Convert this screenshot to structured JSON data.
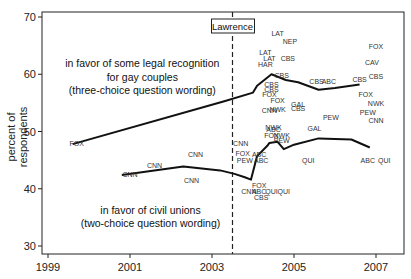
{
  "chart_data": {
    "type": "line",
    "title": "",
    "xlabel": "",
    "ylabel": "percent of respondents",
    "xlim": [
      1998.8,
      2007.8
    ],
    "ylim": [
      29.5,
      71
    ],
    "x_ticks": [
      1999,
      2001,
      2003,
      2005,
      2007
    ],
    "y_ticks": [
      30,
      40,
      50,
      60,
      70
    ],
    "grid": false,
    "legend": null,
    "event_line": {
      "x": 2003.5,
      "label": "Lawrence",
      "style": "dashed"
    },
    "annotations": [
      {
        "text": "in favor of some legal recognition",
        "x": 2001.3,
        "y": 61.3
      },
      {
        "text": "for gay couples",
        "x": 2001.3,
        "y": 58.9
      },
      {
        "text": "(three-choice question wording)",
        "x": 2001.3,
        "y": 56.5
      },
      {
        "text": "in favor of civil unions",
        "x": 2001.5,
        "y": 35.6
      },
      {
        "text": "(two-choice question wording)",
        "x": 2001.5,
        "y": 33.3
      }
    ],
    "series": [
      {
        "name": "legal recognition (three-choice wording)",
        "x": [
          1999.6,
          2003.3,
          2004.0,
          2004.1,
          2004.45,
          2004.8,
          2005.1,
          2005.6,
          2006.0,
          2006.6
        ],
        "y": [
          47.8,
          55.3,
          56.8,
          58.0,
          60.0,
          59.0,
          58.6,
          57.3,
          57.6,
          58.2
        ]
      },
      {
        "name": "civil unions (two-choice wording)",
        "x": [
          2000.8,
          2002.3,
          2003.2,
          2003.55,
          2003.8,
          2003.95,
          2004.1,
          2004.35,
          2004.4,
          2004.6,
          2004.75,
          2005.0,
          2005.6,
          2006.4,
          2006.85
        ],
        "y": [
          42.4,
          43.9,
          43.2,
          42.6,
          42.0,
          41.6,
          45.7,
          47.5,
          48.0,
          48.2,
          46.9,
          47.7,
          48.8,
          48.6,
          47.2
        ]
      }
    ],
    "poll_labels": [
      {
        "text": "FOX",
        "x": 1999.7,
        "y": 47.5
      },
      {
        "text": "CNN",
        "x": 2001.0,
        "y": 42.0
      },
      {
        "text": "CNN",
        "x": 2001.6,
        "y": 43.7
      },
      {
        "text": "CNN",
        "x": 2002.6,
        "y": 45.5
      },
      {
        "text": "CNN",
        "x": 2002.5,
        "y": 41.0
      },
      {
        "text": "CNN",
        "x": 2003.7,
        "y": 47.5
      },
      {
        "text": "LAT",
        "x": 2004.6,
        "y": 66.7
      },
      {
        "text": "NEP",
        "x": 2004.9,
        "y": 65.2
      },
      {
        "text": "LAT",
        "x": 2004.3,
        "y": 63.4
      },
      {
        "text": "LAT",
        "x": 2004.4,
        "y": 62.3
      },
      {
        "text": "CBS",
        "x": 2004.85,
        "y": 62.3
      },
      {
        "text": "HAR",
        "x": 2004.3,
        "y": 61.2
      },
      {
        "text": "CBS",
        "x": 2004.7,
        "y": 59.4
      },
      {
        "text": "CBS",
        "x": 2004.45,
        "y": 57.7
      },
      {
        "text": "CBS",
        "x": 2004.45,
        "y": 56.9
      },
      {
        "text": "FOX",
        "x": 2004.4,
        "y": 56.0
      },
      {
        "text": "FOX",
        "x": 2004.6,
        "y": 54.9
      },
      {
        "text": "GAL",
        "x": 2005.1,
        "y": 54.3
      },
      {
        "text": "CBS",
        "x": 2005.1,
        "y": 53.6
      },
      {
        "text": "CNN",
        "x": 2004.4,
        "y": 53.3
      },
      {
        "text": "NWK",
        "x": 2004.6,
        "y": 53.4
      },
      {
        "text": "CBS",
        "x": 2005.55,
        "y": 58.3
      },
      {
        "text": "ABC",
        "x": 2005.85,
        "y": 58.3
      },
      {
        "text": "CBS",
        "x": 2006.6,
        "y": 58.7
      },
      {
        "text": "PEW",
        "x": 2005.9,
        "y": 52.0
      },
      {
        "text": "NWK",
        "x": 2004.5,
        "y": 50.3
      },
      {
        "text": "ABC",
        "x": 2004.5,
        "y": 49.9
      },
      {
        "text": "GAL",
        "x": 2005.5,
        "y": 50.1
      },
      {
        "text": "FOX",
        "x": 2007.0,
        "y": 64.4
      },
      {
        "text": "CAV",
        "x": 2006.9,
        "y": 61.6
      },
      {
        "text": "CBS",
        "x": 2007.0,
        "y": 59.1
      },
      {
        "text": "FOX",
        "x": 2006.75,
        "y": 56.0
      },
      {
        "text": "NWK",
        "x": 2007.0,
        "y": 54.4
      },
      {
        "text": "PEW",
        "x": 2006.8,
        "y": 52.8
      },
      {
        "text": "CNN",
        "x": 2007.0,
        "y": 51.4
      },
      {
        "text": "FOX",
        "x": 2004.45,
        "y": 48.8
      },
      {
        "text": "NWK",
        "x": 2004.7,
        "y": 48.8
      },
      {
        "text": "PEW",
        "x": 2004.7,
        "y": 48.0
      },
      {
        "text": "FOX",
        "x": 2003.75,
        "y": 45.7
      },
      {
        "text": "ABC",
        "x": 2004.15,
        "y": 45.5
      },
      {
        "text": "PEW",
        "x": 2003.8,
        "y": 44.5
      },
      {
        "text": "ABC",
        "x": 2004.2,
        "y": 44.5
      },
      {
        "text": "QUI",
        "x": 2005.35,
        "y": 44.5
      },
      {
        "text": "ABC",
        "x": 2006.8,
        "y": 44.5
      },
      {
        "text": "QUI",
        "x": 2007.2,
        "y": 44.5
      },
      {
        "text": "FOX",
        "x": 2004.15,
        "y": 40.1
      },
      {
        "text": "CNN",
        "x": 2003.9,
        "y": 39.0
      },
      {
        "text": "ABC",
        "x": 2004.15,
        "y": 39.0
      },
      {
        "text": "QUI",
        "x": 2004.45,
        "y": 39.0
      },
      {
        "text": "QUI",
        "x": 2004.75,
        "y": 39.0
      },
      {
        "text": "CBS",
        "x": 2004.2,
        "y": 38.1
      }
    ]
  }
}
